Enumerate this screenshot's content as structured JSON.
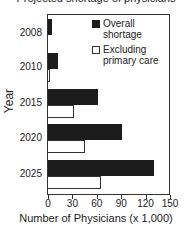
{
  "chart_data": {
    "type": "bar",
    "orientation": "horizontal",
    "title": "Projected shortage of physicians",
    "xlabel": "Number of Physicians (x 1,000)",
    "ylabel": "Year",
    "categories": [
      "2008",
      "2010",
      "2015",
      "2020",
      "2025"
    ],
    "series": [
      {
        "name": "Overall shortage",
        "color": "#1c1c1c",
        "values": [
          5,
          12,
          62,
          91,
          130
        ]
      },
      {
        "name": "Excluding primary care",
        "color": "#ffffff",
        "values": [
          0,
          3,
          32,
          46,
          65
        ]
      }
    ],
    "xlim": [
      0,
      150
    ],
    "xticks": [
      "0",
      "30",
      "60",
      "90",
      "120",
      "150"
    ],
    "grid": false,
    "legend_position": "upper right"
  },
  "legend": {
    "overall_line1": "Overall",
    "overall_line2": "shortage",
    "excl_line1": "Excluding",
    "excl_line2": "primary care"
  }
}
